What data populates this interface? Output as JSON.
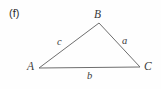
{
  "figure": {
    "panel_label": "(f)",
    "background_color": "#fefefe",
    "stroke_color": "#6e6e6e",
    "text_color": "#3a3a3a",
    "width": 161,
    "height": 89
  },
  "chart_data": {
    "type": "diagram",
    "title": "(f)",
    "subtitle": "",
    "shape": "triangle",
    "grid": false,
    "legend": "none",
    "xlabel": "",
    "ylabel": "",
    "vertices": [
      {
        "name": "A",
        "label": "A",
        "x": 39,
        "y": 68
      },
      {
        "name": "B",
        "label": "B",
        "x": 99,
        "y": 23
      },
      {
        "name": "C",
        "label": "C",
        "x": 140,
        "y": 67
      }
    ],
    "sides": [
      {
        "name": "c",
        "label": "c",
        "from": "A",
        "to": "B",
        "label_x": 60,
        "label_y": 43
      },
      {
        "name": "a",
        "label": "a",
        "from": "B",
        "to": "C",
        "label_x": 125,
        "label_y": 42
      },
      {
        "name": "b",
        "label": "b",
        "from": "A",
        "to": "C",
        "label_x": 90,
        "label_y": 77
      }
    ],
    "polyline_points": "39,68 99,23 140,67 39,68",
    "stroke_width": 1
  },
  "labels": {
    "vertex_a": "A",
    "vertex_b": "B",
    "vertex_c": "C",
    "side_a": "a",
    "side_b": "b",
    "side_c": "c"
  }
}
